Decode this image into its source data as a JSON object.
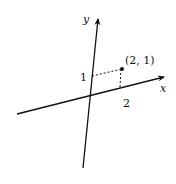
{
  "diagram": {
    "type": "coordinate-axes",
    "axes": {
      "x_label": "x",
      "y_label": "y"
    },
    "point": {
      "label": "(2, 1)",
      "x": 2,
      "y": 1
    },
    "ticks": {
      "x_tick": "2",
      "y_tick": "1"
    },
    "colors": {
      "line": "#111111",
      "background": "#ffffff"
    }
  }
}
